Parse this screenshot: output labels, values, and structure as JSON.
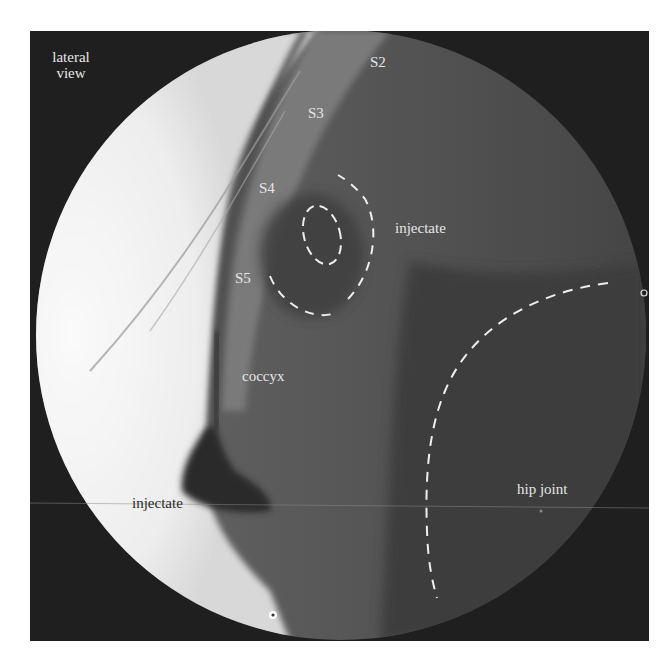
{
  "figure": {
    "view_label": [
      "lateral",
      "view"
    ],
    "labels": {
      "s2": "S2",
      "s3": "S3",
      "s4": "S4",
      "s5": "S5",
      "injectate_upper": "injectate",
      "coccyx": "coccyx",
      "injectate_lower": "injectate",
      "hip_joint": "hip joint"
    },
    "annotations": [
      {
        "type": "dashed-ellipse",
        "target": "injectate (inner)"
      },
      {
        "type": "dashed-arc",
        "target": "injectate (outer)"
      },
      {
        "type": "dashed-arc",
        "target": "hip joint"
      }
    ],
    "markers": [
      {
        "type": "ring-marker",
        "position": "bottom-center"
      },
      {
        "type": "ring-marker",
        "position": "right-edge"
      }
    ],
    "colors": {
      "background": "#1f1f1f",
      "field_bright": "#f4f4f4",
      "soft_tissue": "#555555",
      "annotation": "#eeeeee",
      "label_light": "#e6e6e6",
      "label_dark": "#2a2a2a"
    }
  }
}
